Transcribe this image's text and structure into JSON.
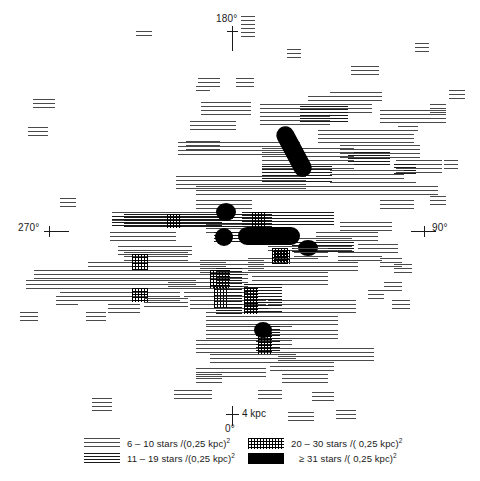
{
  "figure": {
    "width": 480,
    "height": 481,
    "background": "#ffffff"
  },
  "axes": {
    "top_label": "180°",
    "left_label": "270°",
    "right_label": "90°",
    "bottom_label": "0°"
  },
  "scalebar": {
    "length_label": "4 kpc",
    "origin_label": "0°"
  },
  "legend": {
    "left": [
      {
        "swatch": "density-1-hatch",
        "label": "6 – 10 stars /(0,25 kpc)",
        "exponent": "2"
      },
      {
        "swatch": "density-2-hatch",
        "label": "11 – 19 stars /(0,25 kpc)",
        "exponent": "2"
      }
    ],
    "right": [
      {
        "swatch": "density-3-crosshatch",
        "label": "20 – 30  stars /( 0,25 kpc)",
        "exponent": "2"
      },
      {
        "swatch": "density-4-solid",
        "label": "≥ 31  stars /( 0,25 kpc)",
        "exponent": "2"
      }
    ]
  },
  "chart_data": {
    "type": "heatmap",
    "xlabel": "",
    "ylabel": "",
    "projection": "galactic-plane polar, azimuth degrees",
    "grid": false,
    "legend_position": "bottom",
    "azimuth_ticks": [
      {
        "value": 180,
        "label": "180°",
        "position": "top"
      },
      {
        "value": 270,
        "label": "270°",
        "position": "left"
      },
      {
        "value": 90,
        "label": "90°",
        "position": "right"
      },
      {
        "value": 0,
        "label": "0°",
        "position": "bottom"
      }
    ],
    "scale": {
      "bar_length_kpc": 4,
      "label": "4 kpc"
    },
    "density_levels": [
      {
        "level": 1,
        "range": "6 – 10",
        "min": 6,
        "max": 10,
        "unit": "stars /(0,25 kpc)^2",
        "fill": "sparse-horizontal-hatch",
        "color": "#4a4a4a"
      },
      {
        "level": 2,
        "range": "11 – 19",
        "min": 11,
        "max": 19,
        "unit": "stars /(0,25 kpc)^2",
        "fill": "dense-horizontal-hatch",
        "color": "#1a1a1a"
      },
      {
        "level": 3,
        "range": "20 – 30",
        "min": 20,
        "max": 30,
        "unit": "stars /(0,25 kpc)^2",
        "fill": "cross-hatch",
        "color": "#000000"
      },
      {
        "level": 4,
        "range": "≥ 31",
        "min": 31,
        "max": null,
        "unit": "stars /(0,25 kpc)^2",
        "fill": "solid",
        "color": "#000000"
      }
    ],
    "patches": [
      {
        "level": 1,
        "x": 28,
        "y": 127,
        "w": 20,
        "h": 12
      },
      {
        "level": 1,
        "x": 33,
        "y": 99,
        "w": 22,
        "h": 10
      },
      {
        "level": 1,
        "x": 136,
        "y": 31,
        "w": 16,
        "h": 8
      },
      {
        "level": 1,
        "x": 198,
        "y": 78,
        "w": 22,
        "h": 10
      },
      {
        "level": 1,
        "x": 236,
        "y": 78,
        "w": 18,
        "h": 9
      },
      {
        "level": 1,
        "x": 241,
        "y": 16,
        "w": 14,
        "h": 22
      },
      {
        "level": 1,
        "x": 287,
        "y": 49,
        "w": 14,
        "h": 10
      },
      {
        "level": 1,
        "x": 351,
        "y": 66,
        "w": 28,
        "h": 12
      },
      {
        "level": 1,
        "x": 330,
        "y": 92,
        "w": 52,
        "h": 12
      },
      {
        "level": 1,
        "x": 415,
        "y": 43,
        "w": 14,
        "h": 9
      },
      {
        "level": 1,
        "x": 449,
        "y": 90,
        "w": 16,
        "h": 10
      },
      {
        "level": 1,
        "x": 201,
        "y": 102,
        "w": 50,
        "h": 16
      },
      {
        "level": 1,
        "x": 190,
        "y": 121,
        "w": 46,
        "h": 12
      },
      {
        "level": 1,
        "x": 186,
        "y": 141,
        "w": 34,
        "h": 12
      },
      {
        "level": 1,
        "x": 260,
        "y": 104,
        "w": 70,
        "h": 22
      },
      {
        "level": 1,
        "x": 308,
        "y": 96,
        "w": 64,
        "h": 20
      },
      {
        "level": 1,
        "x": 318,
        "y": 130,
        "w": 96,
        "h": 16
      },
      {
        "level": 1,
        "x": 340,
        "y": 145,
        "w": 80,
        "h": 14
      },
      {
        "level": 2,
        "x": 300,
        "y": 106,
        "w": 48,
        "h": 18
      },
      {
        "level": 2,
        "x": 348,
        "y": 152,
        "w": 42,
        "h": 14
      },
      {
        "level": 1,
        "x": 380,
        "y": 110,
        "w": 66,
        "h": 16
      },
      {
        "level": 1,
        "x": 396,
        "y": 160,
        "w": 46,
        "h": 14
      },
      {
        "level": 2,
        "x": 394,
        "y": 164,
        "w": 22,
        "h": 12
      },
      {
        "level": 1,
        "x": 178,
        "y": 142,
        "w": 60,
        "h": 14
      },
      {
        "level": 1,
        "x": 214,
        "y": 142,
        "w": 86,
        "h": 16
      },
      {
        "level": 1,
        "x": 262,
        "y": 148,
        "w": 92,
        "h": 24
      },
      {
        "level": 2,
        "x": 262,
        "y": 166,
        "w": 70,
        "h": 16
      },
      {
        "level": 1,
        "x": 176,
        "y": 176,
        "w": 130,
        "h": 14
      },
      {
        "level": 1,
        "x": 196,
        "y": 186,
        "w": 180,
        "h": 12
      },
      {
        "level": 1,
        "x": 330,
        "y": 170,
        "w": 74,
        "h": 16
      },
      {
        "level": 1,
        "x": 352,
        "y": 182,
        "w": 64,
        "h": 14
      },
      {
        "level": 1,
        "x": 396,
        "y": 186,
        "w": 42,
        "h": 12
      },
      {
        "level": 4,
        "x": 285,
        "y": 124,
        "w": 18,
        "h": 55,
        "shape": "rotated-bar",
        "angle": -28
      },
      {
        "level": 1,
        "x": 60,
        "y": 198,
        "w": 16,
        "h": 12
      },
      {
        "level": 1,
        "x": 112,
        "y": 212,
        "w": 120,
        "h": 10
      },
      {
        "level": 2,
        "x": 112,
        "y": 216,
        "w": 110,
        "h": 12
      },
      {
        "level": 2,
        "x": 124,
        "y": 214,
        "w": 148,
        "h": 14
      },
      {
        "level": 3,
        "x": 167,
        "y": 214,
        "w": 14,
        "h": 14
      },
      {
        "level": 1,
        "x": 196,
        "y": 200,
        "w": 56,
        "h": 12
      },
      {
        "level": 1,
        "x": 206,
        "y": 224,
        "w": 80,
        "h": 10
      },
      {
        "level": 2,
        "x": 242,
        "y": 212,
        "w": 92,
        "h": 14
      },
      {
        "level": 3,
        "x": 252,
        "y": 212,
        "w": 14,
        "h": 16
      },
      {
        "level": 1,
        "x": 110,
        "y": 232,
        "w": 66,
        "h": 12
      },
      {
        "level": 1,
        "x": 118,
        "y": 246,
        "w": 74,
        "h": 10
      },
      {
        "level": 2,
        "x": 214,
        "y": 232,
        "w": 66,
        "h": 12
      },
      {
        "level": 1,
        "x": 268,
        "y": 238,
        "w": 84,
        "h": 14
      },
      {
        "level": 2,
        "x": 292,
        "y": 242,
        "w": 62,
        "h": 12
      },
      {
        "level": 3,
        "x": 274,
        "y": 250,
        "w": 16,
        "h": 14
      },
      {
        "level": 1,
        "x": 316,
        "y": 232,
        "w": 62,
        "h": 12
      },
      {
        "level": 1,
        "x": 340,
        "y": 222,
        "w": 52,
        "h": 12
      },
      {
        "level": 1,
        "x": 358,
        "y": 244,
        "w": 40,
        "h": 12
      },
      {
        "level": 1,
        "x": 380,
        "y": 200,
        "w": 34,
        "h": 12
      },
      {
        "level": 4,
        "x": 216,
        "y": 203,
        "w": 20,
        "h": 18,
        "shape": "ellipse"
      },
      {
        "level": 4,
        "x": 215,
        "y": 228,
        "w": 18,
        "h": 18,
        "shape": "ellipse"
      },
      {
        "level": 4,
        "x": 238,
        "y": 227,
        "w": 62,
        "h": 18,
        "shape": "stadium"
      },
      {
        "level": 4,
        "x": 298,
        "y": 240,
        "w": 20,
        "h": 16,
        "shape": "ellipse"
      },
      {
        "level": 1,
        "x": 34,
        "y": 270,
        "w": 150,
        "h": 12
      },
      {
        "level": 1,
        "x": 26,
        "y": 280,
        "w": 170,
        "h": 12
      },
      {
        "level": 1,
        "x": 60,
        "y": 292,
        "w": 120,
        "h": 12
      },
      {
        "level": 1,
        "x": 88,
        "y": 262,
        "w": 80,
        "h": 10
      },
      {
        "level": 1,
        "x": 124,
        "y": 252,
        "w": 64,
        "h": 10
      },
      {
        "level": 1,
        "x": 130,
        "y": 262,
        "w": 96,
        "h": 12
      },
      {
        "level": 3,
        "x": 132,
        "y": 254,
        "w": 16,
        "h": 16
      },
      {
        "level": 1,
        "x": 168,
        "y": 274,
        "w": 80,
        "h": 14
      },
      {
        "level": 1,
        "x": 184,
        "y": 288,
        "w": 64,
        "h": 12
      },
      {
        "level": 3,
        "x": 132,
        "y": 288,
        "w": 16,
        "h": 14
      },
      {
        "level": 1,
        "x": 200,
        "y": 260,
        "w": 64,
        "h": 14
      },
      {
        "level": 1,
        "x": 190,
        "y": 300,
        "w": 76,
        "h": 12
      },
      {
        "level": 1,
        "x": 206,
        "y": 312,
        "w": 76,
        "h": 14
      },
      {
        "level": 1,
        "x": 206,
        "y": 326,
        "w": 86,
        "h": 14
      },
      {
        "level": 1,
        "x": 196,
        "y": 340,
        "w": 96,
        "h": 14
      },
      {
        "level": 1,
        "x": 210,
        "y": 354,
        "w": 86,
        "h": 12
      },
      {
        "level": 1,
        "x": 196,
        "y": 368,
        "w": 70,
        "h": 12
      },
      {
        "level": 3,
        "x": 210,
        "y": 270,
        "w": 20,
        "h": 18
      },
      {
        "level": 3,
        "x": 214,
        "y": 286,
        "w": 14,
        "h": 22
      },
      {
        "level": 2,
        "x": 216,
        "y": 268,
        "w": 26,
        "h": 48
      },
      {
        "level": 1,
        "x": 248,
        "y": 258,
        "w": 70,
        "h": 14
      },
      {
        "level": 1,
        "x": 252,
        "y": 272,
        "w": 76,
        "h": 14
      },
      {
        "level": 2,
        "x": 244,
        "y": 284,
        "w": 38,
        "h": 28
      },
      {
        "level": 3,
        "x": 244,
        "y": 288,
        "w": 14,
        "h": 26
      },
      {
        "level": 1,
        "x": 268,
        "y": 300,
        "w": 88,
        "h": 14
      },
      {
        "level": 1,
        "x": 264,
        "y": 316,
        "w": 74,
        "h": 12
      },
      {
        "level": 1,
        "x": 272,
        "y": 330,
        "w": 66,
        "h": 12
      },
      {
        "level": 2,
        "x": 256,
        "y": 326,
        "w": 24,
        "h": 26
      },
      {
        "level": 3,
        "x": 258,
        "y": 330,
        "w": 14,
        "h": 24
      },
      {
        "level": 4,
        "x": 254,
        "y": 322,
        "w": 18,
        "h": 16,
        "shape": "ellipse"
      },
      {
        "level": 1,
        "x": 278,
        "y": 348,
        "w": 96,
        "h": 14
      },
      {
        "level": 1,
        "x": 270,
        "y": 362,
        "w": 64,
        "h": 12
      },
      {
        "level": 1,
        "x": 282,
        "y": 374,
        "w": 46,
        "h": 12
      },
      {
        "level": 1,
        "x": 294,
        "y": 248,
        "w": 34,
        "h": 12
      },
      {
        "level": 3,
        "x": 272,
        "y": 248,
        "w": 16,
        "h": 16
      },
      {
        "level": 1,
        "x": 310,
        "y": 262,
        "w": 48,
        "h": 12
      },
      {
        "level": 1,
        "x": 338,
        "y": 252,
        "w": 44,
        "h": 12
      },
      {
        "level": 1,
        "x": 380,
        "y": 258,
        "w": 22,
        "h": 12
      },
      {
        "level": 1,
        "x": 394,
        "y": 264,
        "w": 18,
        "h": 10
      },
      {
        "level": 1,
        "x": 384,
        "y": 282,
        "w": 18,
        "h": 10
      },
      {
        "level": 1,
        "x": 392,
        "y": 300,
        "w": 18,
        "h": 10
      },
      {
        "level": 1,
        "x": 368,
        "y": 290,
        "w": 16,
        "h": 10
      },
      {
        "level": 1,
        "x": 86,
        "y": 312,
        "w": 20,
        "h": 12
      },
      {
        "level": 1,
        "x": 56,
        "y": 296,
        "w": 22,
        "h": 10
      },
      {
        "level": 1,
        "x": 20,
        "y": 312,
        "w": 18,
        "h": 10
      },
      {
        "level": 1,
        "x": 144,
        "y": 298,
        "w": 44,
        "h": 12
      },
      {
        "level": 1,
        "x": 108,
        "y": 304,
        "w": 32,
        "h": 10
      },
      {
        "level": 1,
        "x": 92,
        "y": 398,
        "w": 20,
        "h": 14
      },
      {
        "level": 1,
        "x": 196,
        "y": 374,
        "w": 26,
        "h": 12
      },
      {
        "level": 1,
        "x": 288,
        "y": 412,
        "w": 26,
        "h": 12
      },
      {
        "level": 1,
        "x": 336,
        "y": 410,
        "w": 20,
        "h": 12
      },
      {
        "level": 1,
        "x": 312,
        "y": 392,
        "w": 22,
        "h": 10
      },
      {
        "level": 1,
        "x": 258,
        "y": 390,
        "w": 24,
        "h": 10
      },
      {
        "level": 1,
        "x": 174,
        "y": 390,
        "w": 38,
        "h": 12
      },
      {
        "level": 1,
        "x": 430,
        "y": 104,
        "w": 16,
        "h": 10
      },
      {
        "level": 1,
        "x": 398,
        "y": 122,
        "w": 20,
        "h": 12
      },
      {
        "level": 1,
        "x": 444,
        "y": 160,
        "w": 14,
        "h": 10
      },
      {
        "level": 1,
        "x": 430,
        "y": 196,
        "w": 16,
        "h": 10
      },
      {
        "level": 1,
        "x": 196,
        "y": 86,
        "w": 14,
        "h": 8
      }
    ]
  }
}
